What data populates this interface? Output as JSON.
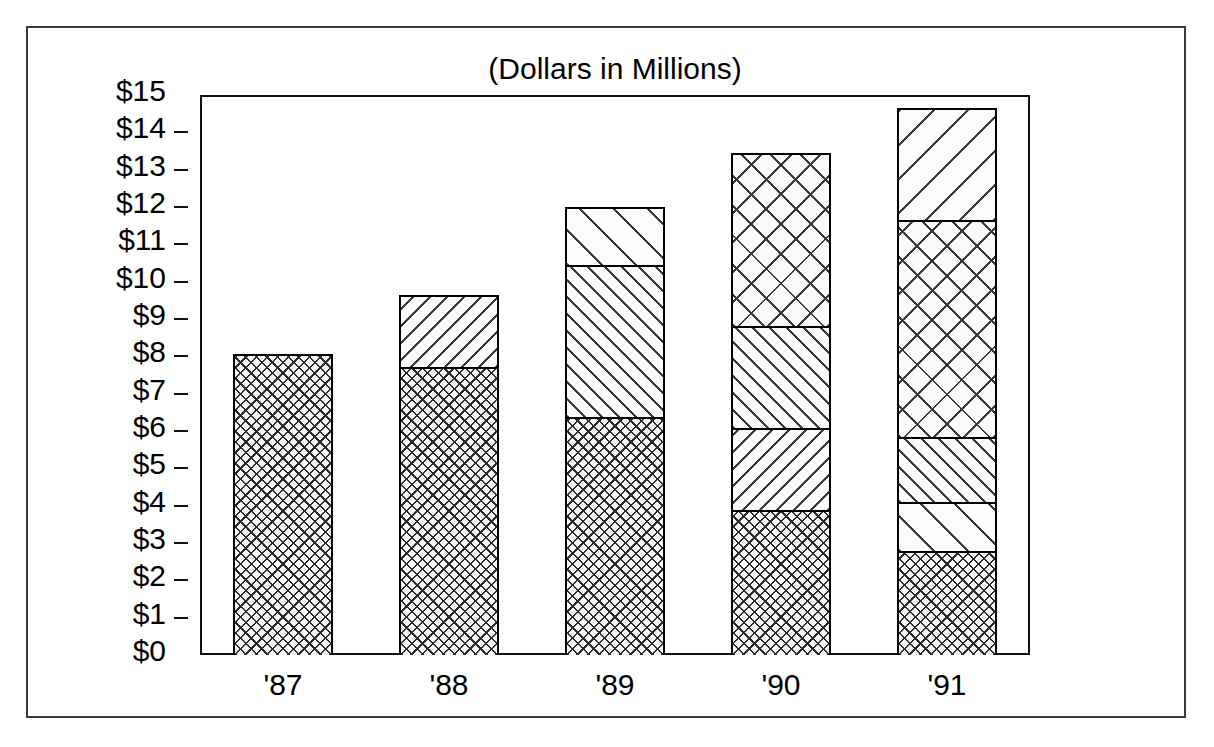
{
  "chart_data": {
    "type": "bar",
    "subtype": "stacked-bar",
    "title": "(Dollars in Millions)",
    "xlabel": "",
    "ylabel": "",
    "categories": [
      "'87",
      "'88",
      "'89",
      "'90",
      "'91"
    ],
    "ylim": [
      0,
      15
    ],
    "ytick_step": 1,
    "ytick_labels": [
      "$15",
      "$14",
      "$13",
      "$12",
      "$11",
      "$10",
      "$9",
      "$8",
      "$7",
      "$6",
      "$5",
      "$4",
      "$3",
      "$2",
      "$1",
      "$0"
    ],
    "ytick_values": [
      15,
      14,
      13,
      12,
      11,
      10,
      9,
      8,
      7,
      6,
      5,
      4,
      3,
      2,
      1,
      0
    ],
    "grid": false,
    "legend": null,
    "legend_position": "none",
    "series": [
      {
        "name": "Segment 1",
        "pattern": "fine-crosshatch",
        "values": [
          8.05,
          7.75,
          6.4,
          3.9,
          2.8
        ]
      },
      {
        "name": "Segment 2",
        "pattern": "diagonal-backward-dense",
        "values": [
          0,
          1.9,
          0,
          0,
          0
        ]
      },
      {
        "name": "Segment 3",
        "pattern": "diagonal-forward-dense",
        "values": [
          0,
          0,
          4.1,
          2.2,
          0
        ]
      },
      {
        "name": "Segment 4",
        "pattern": "diagonal-forward-sparse",
        "values": [
          0,
          0,
          1.5,
          0,
          1.3
        ]
      },
      {
        "name": "Segment 5",
        "pattern": "diagonal-backward-sparse",
        "values": [
          0,
          0,
          0,
          0,
          0
        ]
      }
    ],
    "totals": [
      8.05,
      9.65,
      12.0,
      13.45,
      14.65
    ],
    "bars": [
      {
        "category": "'87",
        "total": 8.05,
        "segments": [
          {
            "label": "'87 segment 1",
            "value": 8.05,
            "pattern": "fine-crosshatch",
            "top": 8.05,
            "bottom": 0
          }
        ]
      },
      {
        "category": "'88",
        "total": 9.65,
        "segments": [
          {
            "label": "'88 segment 2",
            "value": 1.9,
            "pattern": "diagonal-backward-dense",
            "top": 9.65,
            "bottom": 7.75
          },
          {
            "label": "'88 segment 1",
            "value": 7.75,
            "pattern": "fine-crosshatch",
            "top": 7.75,
            "bottom": 0
          }
        ]
      },
      {
        "category": "'89",
        "total": 12.0,
        "segments": [
          {
            "label": "'89 segment 3",
            "value": 1.5,
            "pattern": "diagonal-forward-sparse",
            "top": 12.0,
            "bottom": 10.5
          },
          {
            "label": "'89 segment 2",
            "value": 4.1,
            "pattern": "diagonal-forward-dense",
            "top": 10.5,
            "bottom": 6.4
          },
          {
            "label": "'89 segment 1",
            "value": 6.4,
            "pattern": "fine-crosshatch",
            "top": 6.4,
            "bottom": 0
          }
        ]
      },
      {
        "category": "'90",
        "total": 13.45,
        "segments": [
          {
            "label": "'90 segment 4",
            "value": 4.6,
            "pattern": "coarse-crosshatch",
            "top": 13.45,
            "bottom": 8.85
          },
          {
            "label": "'90 segment 3",
            "value": 2.75,
            "pattern": "diagonal-forward-dense",
            "top": 8.85,
            "bottom": 6.1
          },
          {
            "label": "'90 segment 2",
            "value": 2.2,
            "pattern": "diagonal-backward-dense",
            "top": 6.1,
            "bottom": 3.9
          },
          {
            "label": "'90 segment 1",
            "value": 3.9,
            "pattern": "fine-crosshatch",
            "top": 3.9,
            "bottom": 0
          }
        ]
      },
      {
        "category": "'91",
        "total": 14.65,
        "segments": [
          {
            "label": "'91 segment 5",
            "value": 2.95,
            "pattern": "diagonal-backward-sparse",
            "top": 14.65,
            "bottom": 11.7
          },
          {
            "label": "'91 segment 4",
            "value": 5.85,
            "pattern": "coarse-crosshatch",
            "top": 11.7,
            "bottom": 5.85
          },
          {
            "label": "'91 segment 3",
            "value": 1.75,
            "pattern": "diagonal-forward-dense",
            "top": 5.85,
            "bottom": 4.1
          },
          {
            "label": "'91 segment 2",
            "value": 1.3,
            "pattern": "diagonal-forward-sparse",
            "top": 4.1,
            "bottom": 2.8
          },
          {
            "label": "'91 segment 1",
            "value": 2.8,
            "pattern": "fine-crosshatch",
            "top": 2.8,
            "bottom": 0
          }
        ]
      }
    ]
  },
  "colors": {
    "ink": "#000000",
    "frame": "#3a3a3a",
    "hatch": "#3a3a3a",
    "paper": "#ffffff"
  }
}
